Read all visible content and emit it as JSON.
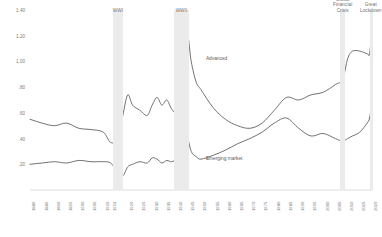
{
  "chart_data": {
    "type": "line",
    "title": "",
    "subtitle": "",
    "xlabel": "",
    "ylabel": "",
    "ylim": [
      0,
      1.4
    ],
    "xlim": [
      1880,
      2020
    ],
    "grid": false,
    "legend_position": "inline-annotations",
    "ytick_labels": [
      "1.40",
      "1.20",
      "1.00",
      ".80",
      ".60",
      ".40",
      ".20"
    ],
    "ytick_values": [
      1.4,
      1.2,
      1.0,
      0.8,
      0.6,
      0.4,
      0.2
    ],
    "xtick_labels": [
      "1880",
      "1885",
      "1890",
      "1895",
      "1900",
      "1905",
      "1910",
      "1913",
      "1920",
      "1925",
      "1930",
      "1935",
      "1940",
      "1945",
      "1950",
      "1955",
      "1960",
      "1965",
      "1970",
      "1975",
      "1980",
      "1985",
      "1990",
      "1995",
      "2000",
      "2005",
      "2010",
      "2015",
      "2020"
    ],
    "series": [
      {
        "name": "Advanced",
        "color": "#595959",
        "x": [
          1880,
          1885,
          1890,
          1895,
          1900,
          1905,
          1910,
          1913,
          1916,
          1918,
          1920,
          1922,
          1925,
          1928,
          1930,
          1932,
          1934,
          1936,
          1938,
          1940,
          1942,
          1944,
          1946,
          1948,
          1950,
          1955,
          1960,
          1965,
          1970,
          1975,
          1980,
          1985,
          1990,
          1995,
          2000,
          2005,
          2008,
          2010,
          2012,
          2015,
          2018,
          2019,
          2020
        ],
        "y": [
          0.55,
          0.52,
          0.5,
          0.52,
          0.48,
          0.47,
          0.45,
          0.37,
          0.4,
          0.58,
          0.74,
          0.66,
          0.62,
          0.58,
          0.66,
          0.72,
          0.66,
          0.7,
          0.63,
          0.62,
          0.88,
          1.25,
          1.0,
          0.84,
          0.78,
          0.64,
          0.55,
          0.5,
          0.48,
          0.52,
          0.62,
          0.72,
          0.7,
          0.74,
          0.76,
          0.82,
          0.86,
          1.02,
          1.08,
          1.08,
          1.06,
          1.06,
          1.25
        ]
      },
      {
        "name": "Emerging market",
        "color": "#595959",
        "x": [
          1880,
          1885,
          1890,
          1895,
          1900,
          1905,
          1910,
          1913,
          1916,
          1918,
          1920,
          1922,
          1925,
          1928,
          1930,
          1932,
          1934,
          1936,
          1938,
          1940,
          1942,
          1944,
          1946,
          1948,
          1950,
          1955,
          1960,
          1965,
          1970,
          1975,
          1980,
          1985,
          1990,
          1995,
          2000,
          2005,
          2008,
          2010,
          2012,
          2015,
          2018,
          2019,
          2020
        ],
        "y": [
          0.2,
          0.21,
          0.22,
          0.21,
          0.23,
          0.22,
          0.22,
          0.21,
          0.14,
          0.11,
          0.18,
          0.2,
          0.22,
          0.21,
          0.25,
          0.24,
          0.21,
          0.23,
          0.22,
          0.25,
          0.36,
          0.43,
          0.3,
          0.26,
          0.24,
          0.27,
          0.31,
          0.36,
          0.4,
          0.45,
          0.52,
          0.56,
          0.48,
          0.42,
          0.44,
          0.4,
          0.38,
          0.4,
          0.42,
          0.45,
          0.52,
          0.56,
          0.68
        ]
      }
    ],
    "bands": [
      {
        "label": "WWI",
        "start": 1914,
        "end": 1918,
        "color": "#ebebeb"
      },
      {
        "label": "WWII",
        "start": 1939,
        "end": 1945,
        "color": "#ebebeb"
      },
      {
        "label": "Global\nFinancial\nCrisis",
        "start": 2007,
        "end": 2009,
        "color": "#ebebeb"
      },
      {
        "label": "Great\nLockdown",
        "start": 2019,
        "end": 2020,
        "color": "#ebebeb"
      }
    ],
    "annotations": [
      {
        "text": "Advanced",
        "x": 1952,
        "y": 1.02
      },
      {
        "text": "Emerging market",
        "x": 1952,
        "y": 0.24
      }
    ]
  }
}
